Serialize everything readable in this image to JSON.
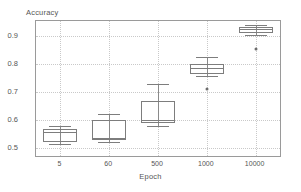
{
  "chart_data": {
    "type": "box",
    "title": "",
    "ylabel": "Accuracy",
    "xlabel": "Epoch",
    "categories": [
      "5",
      "60",
      "500",
      "1000",
      "10000"
    ],
    "ylim": [
      0.47,
      0.955
    ],
    "yticks": [
      0.5,
      0.6,
      0.7,
      0.8,
      0.9
    ],
    "ytick_labels": [
      "0.5",
      "0.6",
      "0.7",
      "0.8",
      "0.9"
    ],
    "grid": true,
    "legend": false,
    "boxes": [
      {
        "category": "5",
        "whisker_low": 0.512,
        "q1": 0.521,
        "median": 0.556,
        "q3": 0.566,
        "whisker_high": 0.576,
        "outliers": []
      },
      {
        "category": "60",
        "whisker_low": 0.519,
        "q1": 0.526,
        "median": 0.535,
        "q3": 0.601,
        "whisker_high": 0.621,
        "outliers": []
      },
      {
        "category": "500",
        "whisker_low": 0.578,
        "q1": 0.59,
        "median": 0.601,
        "q3": 0.666,
        "whisker_high": 0.727,
        "outliers": []
      },
      {
        "category": "1000",
        "whisker_low": 0.757,
        "q1": 0.766,
        "median": 0.786,
        "q3": 0.8,
        "whisker_high": 0.826,
        "outliers": [
          0.712
        ]
      },
      {
        "category": "10000",
        "whisker_low": 0.906,
        "q1": 0.911,
        "median": 0.928,
        "q3": 0.933,
        "whisker_high": 0.941,
        "outliers": [
          0.856
        ]
      }
    ]
  },
  "colors": {
    "line": "#7d7d7d",
    "grid": "#c9c9c9",
    "frame": "#9a9a9a",
    "text": "#555555",
    "outlier": "#6d6d6d"
  }
}
